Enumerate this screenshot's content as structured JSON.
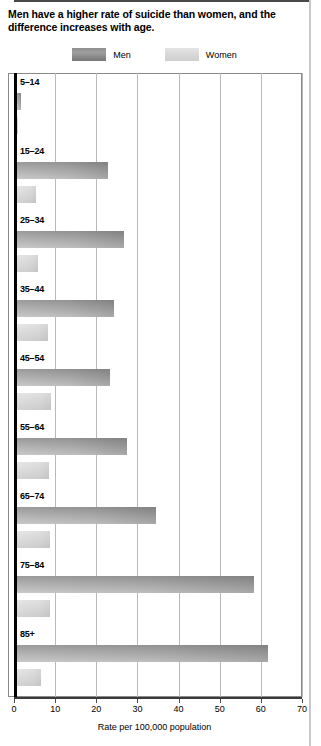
{
  "title": "Men have a higher rate of suicide than women, and the difference increases with age.",
  "legend": {
    "men": "Men",
    "women": "Women",
    "men_color": "#a4a4a4",
    "women_color": "#dedede"
  },
  "axis_title": "Rate per 100,000 population",
  "chart_data": {
    "type": "bar",
    "orientation": "horizontal",
    "title": "Men have a higher rate of suicide than women, and the difference increases with age.",
    "categories": [
      "5–14",
      "15–24",
      "25–34",
      "35–44",
      "45–54",
      "55–64",
      "65–74",
      "75–84",
      "85+"
    ],
    "series": [
      {
        "name": "Men",
        "values": [
          1.0,
          22.0,
          26.0,
          23.5,
          22.5,
          26.7,
          33.8,
          57.7,
          61.0
        ],
        "color": "#a4a4a4"
      },
      {
        "name": "Women",
        "values": [
          0.3,
          4.5,
          5.0,
          7.5,
          8.3,
          7.8,
          8.0,
          8.0,
          5.8
        ],
        "color": "#dedede"
      }
    ],
    "xlabel": "Rate per 100,000 population",
    "ylabel": "",
    "xlim": [
      0,
      70
    ],
    "xticks": [
      0,
      10,
      20,
      30,
      40,
      50,
      60,
      70
    ],
    "xtick_labels": [
      "0",
      "10",
      "20",
      "30",
      "40",
      "50",
      "60",
      "70"
    ],
    "grid": "vertical",
    "legend_position": "top-center"
  }
}
